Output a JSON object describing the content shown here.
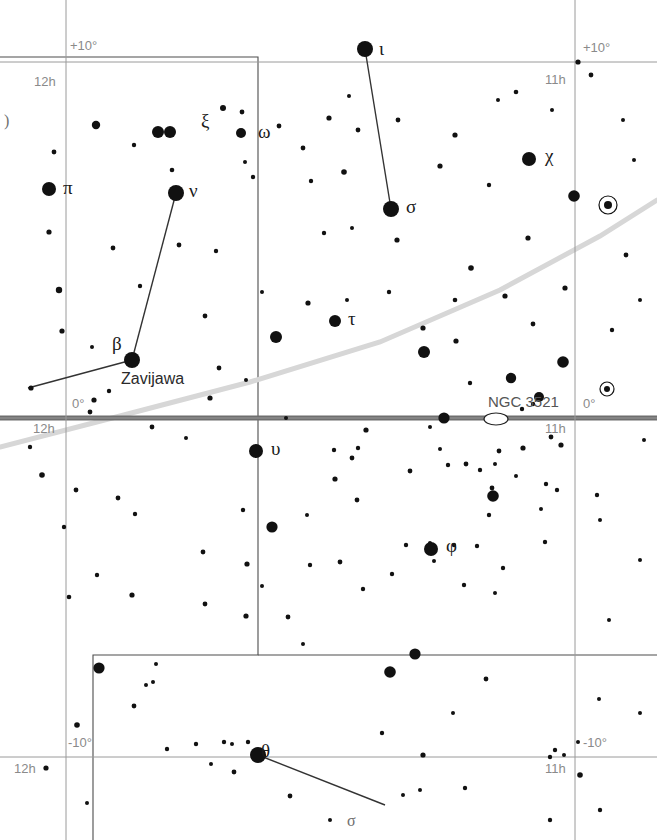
{
  "chart": {
    "type": "star-chart",
    "width": 657,
    "height": 840,
    "background_color": "#ffffff",
    "star_color": "#111111",
    "grid_color": "#9a9a9a",
    "equator_color": "#6e6e6e",
    "ecliptic_color": "#d7d7d7",
    "boundary_color": "#4d4d4d",
    "constellation_line_color": "#333333"
  },
  "grid": {
    "ra_lines": [
      {
        "name": "12h",
        "x": 66
      },
      {
        "name": "11h",
        "x": 575
      }
    ],
    "dec_lines": [
      {
        "name": "+10deg",
        "y": 62
      },
      {
        "name": "0deg",
        "y": 418
      },
      {
        "name": "-10deg",
        "y": 757
      }
    ],
    "labels": [
      {
        "id": "dec-plus10-left",
        "text": "+10°",
        "x": 70,
        "y": 38
      },
      {
        "id": "dec-plus10-right",
        "text": "+10°",
        "x": 583,
        "y": 40
      },
      {
        "id": "ra-12h-top",
        "text": "12h",
        "x": 34,
        "y": 74
      },
      {
        "id": "ra-11h-top",
        "text": "11h",
        "x": 545,
        "y": 72
      },
      {
        "id": "dec-0-left",
        "text": "0°",
        "x": 72,
        "y": 396
      },
      {
        "id": "dec-0-right",
        "text": "0°",
        "x": 583,
        "y": 396
      },
      {
        "id": "ra-12h-mid",
        "text": "12h",
        "x": 33,
        "y": 421
      },
      {
        "id": "ra-11h-mid",
        "text": "11h",
        "x": 545,
        "y": 421
      },
      {
        "id": "dec-minus10-left",
        "text": "-10°",
        "x": 68,
        "y": 735
      },
      {
        "id": "dec-minus10-right",
        "text": "-10°",
        "x": 583,
        "y": 735
      },
      {
        "id": "ra-12h-bottom",
        "text": "12h",
        "x": 14,
        "y": 761
      },
      {
        "id": "ra-11h-bottom",
        "text": "11h",
        "x": 545,
        "y": 761
      }
    ]
  },
  "equator": {
    "y": 418,
    "x1": 0,
    "x2": 657,
    "thickness": 5
  },
  "ecliptic": {
    "points": [
      [
        0,
        447
      ],
      [
        120,
        416
      ],
      [
        250,
        382
      ],
      [
        380,
        342
      ],
      [
        500,
        290
      ],
      [
        600,
        236
      ],
      [
        657,
        200
      ]
    ]
  },
  "boundaries": [
    {
      "id": "virgo-leo-boundary",
      "points": [
        [
          0,
          57
        ],
        [
          258,
          57
        ],
        [
          258,
          655
        ],
        [
          93,
          655
        ],
        [
          93,
          840
        ]
      ]
    },
    {
      "id": "boundary-right-step",
      "points": [
        [
          258,
          655
        ],
        [
          657,
          655
        ]
      ]
    }
  ],
  "constellation_lines": [
    {
      "id": "iota-sigma",
      "from": [
        365,
        49
      ],
      "to": [
        391,
        209
      ]
    },
    {
      "id": "nu-beta",
      "from": [
        176,
        193
      ],
      "to": [
        132,
        360
      ]
    },
    {
      "id": "beta-west",
      "from": [
        132,
        360
      ],
      "to": [
        28,
        388
      ]
    },
    {
      "id": "theta-southeast",
      "from": [
        258,
        755
      ],
      "to": [
        385,
        805
      ]
    }
  ],
  "named_stars": [
    {
      "id": "iota",
      "label": "ι",
      "x": 365,
      "y": 49,
      "r": 8,
      "lx": 379,
      "ly": 38
    },
    {
      "id": "nu",
      "label": "ν",
      "x": 176,
      "y": 193,
      "r": 8,
      "lx": 189,
      "ly": 180
    },
    {
      "id": "xi",
      "label": "ξ",
      "x": 170,
      "y": 132,
      "r": 6,
      "lx": 201,
      "ly": 110
    },
    {
      "id": "omega",
      "label": "ω",
      "x": 241,
      "y": 133,
      "r": 5,
      "lx": 258,
      "ly": 121
    },
    {
      "id": "pi",
      "label": "π",
      "x": 49,
      "y": 189,
      "r": 7,
      "lx": 63,
      "ly": 177
    },
    {
      "id": "chi",
      "label": "χ",
      "x": 529,
      "y": 159,
      "r": 7,
      "lx": 545,
      "ly": 145
    },
    {
      "id": "sigma",
      "label": "σ",
      "x": 391,
      "y": 209,
      "r": 8,
      "lx": 406,
      "ly": 196
    },
    {
      "id": "tau",
      "label": "τ",
      "x": 335,
      "y": 321,
      "r": 6,
      "lx": 348,
      "ly": 308
    },
    {
      "id": "beta",
      "label": "β",
      "x": 132,
      "y": 360,
      "r": 8,
      "lx": 112,
      "ly": 333
    },
    {
      "id": "upsilon",
      "label": "υ",
      "x": 256,
      "y": 451,
      "r": 7,
      "lx": 271,
      "ly": 438
    },
    {
      "id": "phi",
      "label": "φ",
      "x": 431,
      "y": 549,
      "r": 7,
      "lx": 446,
      "ly": 535
    },
    {
      "id": "theta",
      "label": "θ",
      "x": 258,
      "y": 755,
      "r": 8,
      "lx": 261,
      "ly": 740
    }
  ],
  "proper_names": [
    {
      "id": "zavijava",
      "text": "Zavijawa",
      "x": 121,
      "y": 370
    }
  ],
  "deep_sky_objects": [
    {
      "id": "ngc3521",
      "label": "NGC 3521",
      "x": 496,
      "y": 419,
      "rx": 12,
      "ry": 6,
      "lx": 488,
      "ly": 393
    }
  ],
  "variable_stars": [
    {
      "id": "variable-1",
      "x": 608,
      "y": 205,
      "r": 4,
      "ring": 9
    },
    {
      "id": "variable-2",
      "x": 607,
      "y": 389,
      "r": 3,
      "ring": 7
    }
  ],
  "stray_marks": [
    {
      "id": "stray-paren-left",
      "text": ")",
      "x": 4,
      "y": 112
    },
    {
      "id": "stray-glyph-bottom",
      "text": "σ",
      "x": 347,
      "y": 812
    }
  ],
  "field_stars": [
    [
      96,
      125,
      4.2
    ],
    [
      134,
      145,
      2.2
    ],
    [
      158,
      132,
      6.0
    ],
    [
      223,
      108,
      3.0
    ],
    [
      242,
      112,
      2.4
    ],
    [
      279,
      126,
      2.4
    ],
    [
      245,
      162,
      2.0
    ],
    [
      329,
      118,
      2.6
    ],
    [
      303,
      148,
      2.4
    ],
    [
      358,
      130,
      2.4
    ],
    [
      311,
      181,
      2.2
    ],
    [
      349,
      96,
      2.0
    ],
    [
      398,
      120,
      2.4
    ],
    [
      455,
      135,
      2.6
    ],
    [
      498,
      100,
      2.0
    ],
    [
      440,
      166,
      2.6
    ],
    [
      489,
      185,
      2.2
    ],
    [
      516,
      92,
      2.3
    ],
    [
      552,
      110,
      2.0
    ],
    [
      578,
      62,
      2.6
    ],
    [
      591,
      75,
      2.4
    ],
    [
      574,
      196,
      5.8
    ],
    [
      528,
      238,
      2.6
    ],
    [
      344,
      172,
      2.8
    ],
    [
      172,
      170,
      2.3
    ],
    [
      253,
      177,
      2.2
    ],
    [
      49,
      232,
      2.6
    ],
    [
      59,
      290,
      3.2
    ],
    [
      113,
      248,
      2.4
    ],
    [
      179,
      245,
      2.4
    ],
    [
      216,
      251,
      2.2
    ],
    [
      140,
      286,
      2.2
    ],
    [
      62,
      331,
      2.6
    ],
    [
      92,
      347,
      2.0
    ],
    [
      205,
      316,
      2.4
    ],
    [
      262,
      292,
      2.0
    ],
    [
      276,
      337,
      6.0
    ],
    [
      308,
      303,
      2.6
    ],
    [
      347,
      300,
      2.0
    ],
    [
      324,
      233,
      2.2
    ],
    [
      352,
      228,
      2.0
    ],
    [
      389,
      292,
      2.2
    ],
    [
      397,
      240,
      2.6
    ],
    [
      423,
      328,
      2.6
    ],
    [
      424,
      352,
      6.0
    ],
    [
      456,
      341,
      2.6
    ],
    [
      455,
      300,
      2.3
    ],
    [
      471,
      268,
      2.8
    ],
    [
      505,
      296,
      2.6
    ],
    [
      533,
      324,
      2.4
    ],
    [
      565,
      288,
      2.6
    ],
    [
      563,
      362,
      5.8
    ],
    [
      470,
      383,
      2.2
    ],
    [
      511,
      378,
      5.2
    ],
    [
      444,
      418,
      5.6
    ],
    [
      505,
      418,
      2.6
    ],
    [
      522,
      409,
      2.2
    ],
    [
      533,
      404,
      2.2
    ],
    [
      539,
      397,
      5.0
    ],
    [
      551,
      437,
      2.4
    ],
    [
      523,
      448,
      2.6
    ],
    [
      499,
      451,
      2.4
    ],
    [
      440,
      449,
      2.0
    ],
    [
      430,
      427,
      2.0
    ],
    [
      366,
      430,
      2.6
    ],
    [
      358,
      448,
      2.2
    ],
    [
      352,
      458,
      2.4
    ],
    [
      334,
      450,
      2.2
    ],
    [
      286,
      418,
      2.0
    ],
    [
      152,
      427,
      2.4
    ],
    [
      186,
      438,
      2.0
    ],
    [
      94,
      400,
      2.6
    ],
    [
      109,
      391,
      2.2
    ],
    [
      30,
      447,
      2.2
    ],
    [
      42,
      475,
      2.8
    ],
    [
      76,
      490,
      2.4
    ],
    [
      64,
      527,
      2.2
    ],
    [
      118,
      498,
      2.4
    ],
    [
      135,
      514,
      2.2
    ],
    [
      243,
      510,
      2.2
    ],
    [
      335,
      479,
      2.6
    ],
    [
      357,
      500,
      2.4
    ],
    [
      307,
      515,
      2.0
    ],
    [
      272,
      527,
      5.6
    ],
    [
      247,
      564,
      2.6
    ],
    [
      310,
      565,
      2.2
    ],
    [
      246,
      616,
      2.6
    ],
    [
      288,
      617,
      2.4
    ],
    [
      132,
      595,
      2.6
    ],
    [
      97,
      575,
      2.2
    ],
    [
      69,
      597,
      2.3
    ],
    [
      205,
      604,
      2.4
    ],
    [
      203,
      552,
      2.4
    ],
    [
      410,
      471,
      2.4
    ],
    [
      466,
      464,
      2.4
    ],
    [
      480,
      470,
      2.2
    ],
    [
      495,
      464,
      2.0
    ],
    [
      492,
      488,
      2.4
    ],
    [
      448,
      465,
      2.2
    ],
    [
      493,
      496,
      5.8
    ],
    [
      489,
      515,
      2.2
    ],
    [
      516,
      476,
      2.0
    ],
    [
      546,
      484,
      2.2
    ],
    [
      557,
      490,
      2.2
    ],
    [
      541,
      509,
      2.0
    ],
    [
      434,
      561,
      2.0
    ],
    [
      545,
      542,
      2.2
    ],
    [
      430,
      543,
      2.0
    ],
    [
      477,
      546,
      2.2
    ],
    [
      454,
      545,
      2.2
    ],
    [
      561,
      445,
      2.6
    ],
    [
      597,
      495,
      2.2
    ],
    [
      600,
      520,
      2.0
    ],
    [
      503,
      568,
      2.2
    ],
    [
      464,
      585,
      2.2
    ],
    [
      495,
      593,
      2.0
    ],
    [
      363,
      589,
      2.2
    ],
    [
      392,
      574,
      2.2
    ],
    [
      340,
      562,
      2.4
    ],
    [
      406,
      545,
      2.2
    ],
    [
      262,
      586,
      2.0
    ],
    [
      415,
      654,
      5.6
    ],
    [
      303,
      644,
      2.0
    ],
    [
      156,
      664,
      2.0
    ],
    [
      146,
      685,
      2.0
    ],
    [
      153,
      682,
      2.0
    ],
    [
      134,
      706,
      2.4
    ],
    [
      77,
      725,
      2.8
    ],
    [
      224,
      742,
      2.2
    ],
    [
      232,
      744,
      2.0
    ],
    [
      248,
      742,
      2.2
    ],
    [
      264,
      756,
      2.0
    ],
    [
      234,
      772,
      2.4
    ],
    [
      167,
      749,
      2.2
    ],
    [
      196,
      744,
      2.2
    ],
    [
      211,
      764,
      2.0
    ],
    [
      46,
      768,
      2.6
    ],
    [
      87,
      803,
      2.0
    ],
    [
      99,
      668,
      5.6
    ],
    [
      390,
      672,
      5.8
    ],
    [
      486,
      679,
      2.4
    ],
    [
      453,
      713,
      2.0
    ],
    [
      382,
      733,
      2.2
    ],
    [
      423,
      755,
      2.6
    ],
    [
      555,
      750,
      2.2
    ],
    [
      564,
      755,
      2.0
    ],
    [
      550,
      757,
      2.2
    ],
    [
      578,
      742,
      2.0
    ],
    [
      580,
      775,
      2.8
    ],
    [
      599,
      699,
      2.0
    ],
    [
      640,
      713,
      2.0
    ],
    [
      600,
      810,
      2.2
    ],
    [
      550,
      820,
      2.2
    ],
    [
      403,
      795,
      2.0
    ],
    [
      290,
      796,
      2.4
    ],
    [
      330,
      820,
      2.0
    ],
    [
      420,
      790,
      2.0
    ],
    [
      465,
      788,
      2.2
    ],
    [
      623,
      120,
      2.0
    ],
    [
      634,
      160,
      2.0
    ],
    [
      626,
      255,
      2.4
    ],
    [
      640,
      300,
      2.0
    ],
    [
      612,
      330,
      2.2
    ],
    [
      644,
      440,
      2.0
    ],
    [
      640,
      560,
      2.0
    ],
    [
      609,
      620,
      2.0
    ],
    [
      54,
      152,
      2.4
    ],
    [
      31,
      388,
      2.6
    ],
    [
      246,
      380,
      2.0
    ],
    [
      219,
      368,
      2.4
    ],
    [
      210,
      398,
      2.6
    ],
    [
      90,
      412,
      2.4
    ]
  ]
}
